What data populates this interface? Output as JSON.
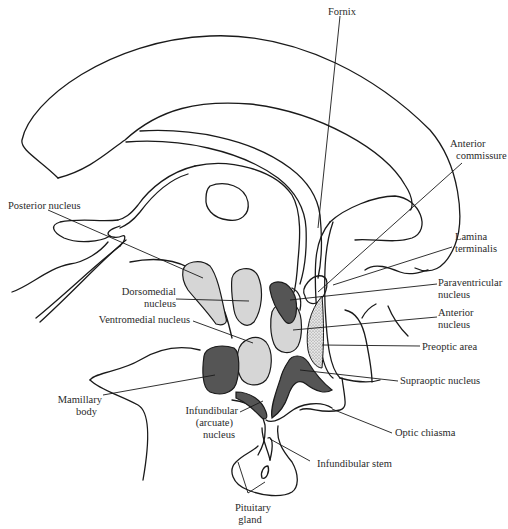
{
  "figure": {
    "colors": {
      "background": "#ffffff",
      "outline": "#1a1a1a",
      "light_nucleus": "#d6d6d6",
      "dark_nucleus": "#555555",
      "stipple": "#bdbdbd",
      "label_text": "#2a2a2a"
    }
  },
  "labels": {
    "fornix": "Fornix",
    "anterior_commissure": [
      "Anterior",
      "commissure"
    ],
    "posterior_nucleus": "Posterior nucleus",
    "lamina_terminalis": [
      "Lamina",
      "terminalis"
    ],
    "dorsomedial_nucleus": [
      "Dorsomedial",
      "nucleus"
    ],
    "paraventricular_nucleus": [
      "Paraventricular",
      "nucleus"
    ],
    "anterior_nucleus": [
      "Anterior",
      "nucleus"
    ],
    "ventromedial_nucleus": "Ventromedial nucleus",
    "preoptic_area": "Preoptic area",
    "supraoptic_nucleus": "Supraoptic nucleus",
    "mamillary_body": [
      "Mamillary",
      "body"
    ],
    "infundibular_nucleus": [
      "Infundibular",
      "(arcuate)",
      "nucleus"
    ],
    "optic_chiasma": "Optic chiasma",
    "infundibular_stem": "Infundibular stem",
    "pituitary_gland": [
      "Pituitary",
      "gland"
    ]
  }
}
